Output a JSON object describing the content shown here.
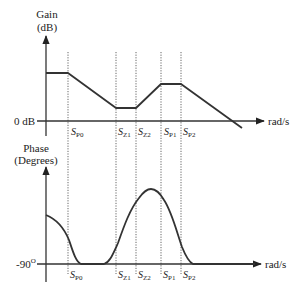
{
  "gain_plot": {
    "y_label_line1": "Gain",
    "y_label_line2": "(dB)",
    "zero_label": "0 dB",
    "x_unit": "rad/s",
    "markers": [
      {
        "main": "S",
        "sub": "P0"
      },
      {
        "main": "S",
        "sub": "Z1"
      },
      {
        "main": "S",
        "sub": "Z2"
      },
      {
        "main": "S",
        "sub": "P1"
      },
      {
        "main": "S",
        "sub": "P2"
      }
    ]
  },
  "phase_plot": {
    "y_label_line1": "Phase",
    "y_label_line2": "(Degrees)",
    "baseline_label": "-90",
    "baseline_sup": "O",
    "x_unit": "rad/s",
    "markers": [
      {
        "main": "S",
        "sub": "P0"
      },
      {
        "main": "S",
        "sub": "Z1"
      },
      {
        "main": "S",
        "sub": "Z2"
      },
      {
        "main": "S",
        "sub": "P1"
      },
      {
        "main": "S",
        "sub": "P2"
      }
    ]
  }
}
